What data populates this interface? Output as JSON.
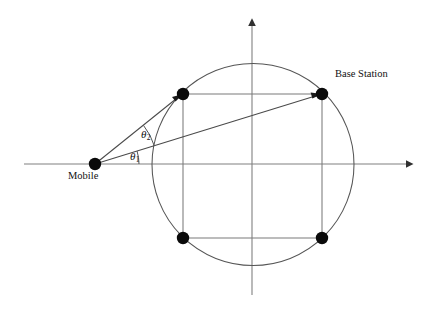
{
  "figure": {
    "background_color": "#ffffff",
    "width": 429,
    "height": 310
  },
  "labels": {
    "mobile": "Mobile",
    "base_station": "Base Station",
    "theta_2_symbol": "θ",
    "theta_2_subscript": "2",
    "theta_1_symbol": "θ",
    "theta_1_subscript": "1"
  },
  "colors": {
    "node": "#0a0a0a",
    "axis": "#808080",
    "circle": "#555555",
    "rectangle": "#7a7a7a",
    "ray": "#4a4a4a",
    "text": "#111111"
  },
  "geometry": {
    "axes": {
      "horizontal": {
        "x1": 24,
        "y1": 164,
        "x2": 412,
        "y2": 164,
        "arrow": "right"
      },
      "vertical": {
        "x1": 252,
        "y1": 295,
        "x2": 252,
        "y2": 18,
        "arrow": "up"
      }
    },
    "scatter_circle": {
      "cx": 253,
      "cy": 164.5,
      "r": 101
    },
    "nodes": [
      {
        "name": "mobile",
        "cx": 95,
        "cy": 164,
        "r": 6.2
      },
      {
        "name": "scatterer-top-left",
        "cx": 183,
        "cy": 94,
        "r": 6.2
      },
      {
        "name": "base-station",
        "cx": 322,
        "cy": 94,
        "r": 6.2
      },
      {
        "name": "scatterer-bottom-left",
        "cx": 183,
        "cy": 238,
        "r": 6.2
      },
      {
        "name": "scatterer-bottom-right",
        "cx": 322,
        "cy": 238,
        "r": 6.2
      }
    ],
    "rectangle_edges": [
      {
        "x1": 183,
        "y1": 94,
        "x2": 322,
        "y2": 94
      },
      {
        "x1": 183,
        "y1": 238,
        "x2": 322,
        "y2": 238
      },
      {
        "x1": 183,
        "y1": 94,
        "x2": 183,
        "y2": 238
      },
      {
        "x1": 322,
        "y1": 94,
        "x2": 322,
        "y2": 238
      }
    ],
    "rays": [
      {
        "name": "mobile-to-scatterer",
        "x1": 95,
        "y1": 164,
        "x2": 183,
        "y2": 94
      },
      {
        "name": "mobile-to-base-station",
        "x1": 95,
        "y1": 164,
        "x2": 322,
        "y2": 94
      }
    ],
    "angle_arcs": [
      {
        "name": "theta-1",
        "radius": 44,
        "from_deg": 0,
        "to_deg": 17.1
      },
      {
        "name": "theta-2",
        "radius": 62,
        "from_deg": 17.1,
        "to_deg": 38.5
      }
    ]
  }
}
